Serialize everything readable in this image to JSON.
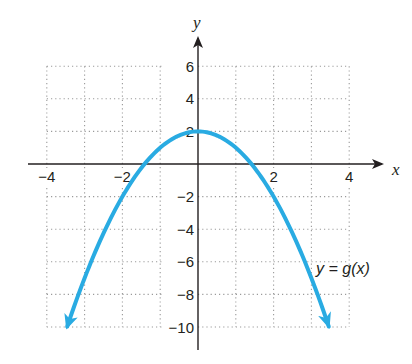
{
  "chart_data": {
    "type": "line",
    "title": "",
    "xlabel": "x",
    "ylabel": "y",
    "xlim": [
      -4,
      4
    ],
    "ylim": [
      -10,
      6
    ],
    "grid": true,
    "grid_style": "dotted",
    "x_ticks": [
      -4,
      -2,
      2,
      4
    ],
    "x_tick_labels": [
      "−4",
      "−2",
      "2",
      "4"
    ],
    "y_ticks": [
      6,
      4,
      2,
      -2,
      -4,
      -6,
      -8,
      -10
    ],
    "y_tick_labels": [
      "6",
      "4",
      "2",
      "−2",
      "−4",
      "−6",
      "−8",
      "−10"
    ],
    "series": [
      {
        "name": "y = g(x)",
        "function": "g(x) = -x^2 + 2",
        "color": "#29abe2",
        "arrows_both_ends": true,
        "x": [
          -3.46,
          -3,
          -2,
          -1,
          0,
          1,
          2,
          3,
          3.46
        ],
        "y": [
          -10,
          -7,
          -2,
          1,
          2,
          1,
          -2,
          -7,
          -10
        ]
      }
    ],
    "annotations": [
      {
        "text": "y = g(x)",
        "x": 3.1,
        "y": -6.5
      }
    ],
    "legend": null
  },
  "labels": {
    "x_axis": "x",
    "y_axis": "y",
    "curve_label": "y = g(x)"
  }
}
